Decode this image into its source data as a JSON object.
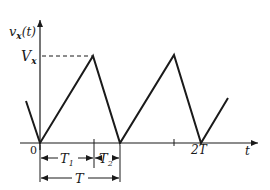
{
  "diagram": {
    "type": "triangular waveform",
    "y_axis_label": "v",
    "y_axis_sub": "x",
    "y_axis_arg": "(t)",
    "x_axis_label": "t",
    "peak_label": "V",
    "peak_sub": "x",
    "origin_label": "0",
    "tick_2T_label": "2T",
    "interval_T1": "T",
    "interval_T1_sub": "1",
    "interval_T2": "T",
    "interval_T2_sub": "2",
    "interval_T": "T",
    "colors": {
      "line": "#1a1a1a",
      "background": "#ffffff"
    }
  }
}
